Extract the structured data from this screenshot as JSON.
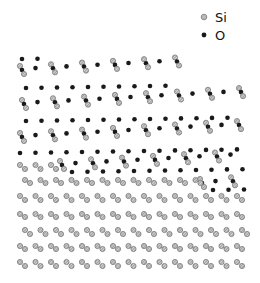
{
  "legend": {
    "items": [
      {
        "label": "Si",
        "color": "#9a9a9a",
        "style": "hatched"
      },
      {
        "label": "O",
        "color": "#1a1a1a",
        "style": "solid"
      }
    ]
  },
  "colors": {
    "si": "#9a9a9a",
    "si_dark": "#555555",
    "o": "#1a1a1a",
    "background": "#ffffff"
  },
  "structure": {
    "description": "Si / SiO2 interface atomic model",
    "oxide_zigzag_rows": [
      {
        "y": 70,
        "x_start": 20,
        "x_end": 180,
        "pitch": 15.5
      },
      {
        "y": 104,
        "x_start": 22,
        "x_end": 245,
        "pitch": 15.5
      },
      {
        "y": 137,
        "x_start": 20,
        "x_end": 245,
        "pitch": 15.5
      },
      {
        "y": 165,
        "x_start": 60,
        "x_end": 245,
        "pitch": 15.5
      },
      {
        "y": 183,
        "x_start": 200,
        "x_end": 245,
        "pitch": 15.5
      }
    ],
    "oxide_o_rows": [
      {
        "y": 59,
        "x_start": 22,
        "x_end": 40,
        "pitch": 15.5
      },
      {
        "y": 88,
        "x_start": 26,
        "x_end": 180,
        "pitch": 15.5
      },
      {
        "y": 121,
        "x_start": 26,
        "x_end": 240,
        "pitch": 15.5
      },
      {
        "y": 153,
        "x_start": 20,
        "x_end": 245,
        "pitch": 15.5
      },
      {
        "y": 172,
        "x_start": 72,
        "x_end": 245,
        "pitch": 15.5
      },
      {
        "y": 190,
        "x_start": 213,
        "x_end": 245,
        "pitch": 15.5
      }
    ],
    "bulk_si_rows": [
      {
        "y": 165,
        "x_start": 20,
        "x_end": 60,
        "pitch": 15.5
      },
      {
        "y": 180,
        "x_start": 25,
        "x_end": 200,
        "pitch": 15.5
      },
      {
        "y": 196,
        "x_start": 20,
        "x_end": 245,
        "pitch": 15.5
      },
      {
        "y": 214,
        "x_start": 20,
        "x_end": 245,
        "pitch": 15.5
      },
      {
        "y": 230,
        "x_start": 25,
        "x_end": 245,
        "pitch": 15.5
      },
      {
        "y": 246,
        "x_start": 20,
        "x_end": 245,
        "pitch": 15.5
      },
      {
        "y": 262,
        "x_start": 20,
        "x_end": 245,
        "pitch": 15.5
      }
    ]
  }
}
